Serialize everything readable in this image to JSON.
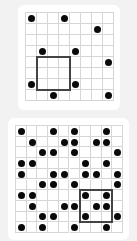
{
  "puzzles": [
    {
      "name": "example-grid",
      "rows": 8,
      "cols": 8,
      "origin": [
        25,
        12
      ],
      "cell": 11,
      "dots": [
        [
          0,
          0
        ],
        [
          0,
          3
        ],
        [
          1,
          6
        ],
        [
          3,
          1
        ],
        [
          3,
          4
        ],
        [
          4,
          7
        ],
        [
          6,
          0
        ],
        [
          6,
          4
        ],
        [
          7,
          2
        ],
        [
          7,
          7
        ]
      ],
      "highlight": {
        "row": 4,
        "col": 1,
        "size": 3
      }
    },
    {
      "name": "main-grid",
      "rows": 10,
      "cols": 10,
      "origin": [
        15,
        125
      ],
      "cell": 10.7,
      "dots": [
        [
          0,
          0
        ],
        [
          0,
          3
        ],
        [
          0,
          5
        ],
        [
          0,
          8
        ],
        [
          1,
          1
        ],
        [
          1,
          4
        ],
        [
          1,
          5
        ],
        [
          1,
          7
        ],
        [
          1,
          8
        ],
        [
          2,
          2
        ],
        [
          2,
          3
        ],
        [
          2,
          5
        ],
        [
          2,
          9
        ],
        [
          3,
          0
        ],
        [
          3,
          1
        ],
        [
          3,
          6
        ],
        [
          3,
          8
        ],
        [
          4,
          0
        ],
        [
          4,
          3
        ],
        [
          4,
          4
        ],
        [
          4,
          6
        ],
        [
          4,
          7
        ],
        [
          4,
          9
        ],
        [
          5,
          2
        ],
        [
          5,
          3
        ],
        [
          5,
          5
        ],
        [
          5,
          9
        ],
        [
          6,
          0
        ],
        [
          6,
          1
        ],
        [
          6,
          6
        ],
        [
          6,
          8
        ],
        [
          7,
          1
        ],
        [
          7,
          4
        ],
        [
          7,
          5
        ],
        [
          7,
          7
        ],
        [
          7,
          8
        ],
        [
          8,
          2
        ],
        [
          8,
          3
        ],
        [
          8,
          6
        ],
        [
          8,
          9
        ],
        [
          9,
          0
        ],
        [
          9,
          2
        ],
        [
          9,
          5
        ],
        [
          9,
          8
        ]
      ],
      "highlight": {
        "row": 6,
        "col": 6,
        "size": 3
      }
    }
  ],
  "colors": {
    "dot": "#0a0a0a",
    "grid_line": "#d6d6d6",
    "highlight_border": "#444444",
    "background": "#f2f2f2"
  }
}
